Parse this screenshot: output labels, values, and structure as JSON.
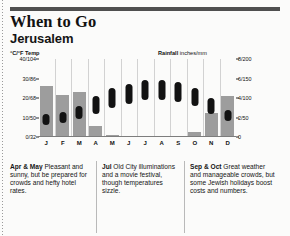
{
  "header": {
    "title": "When to Go",
    "subtitle": "Jerusalem"
  },
  "chart_axes": {
    "left_caption": "°C/°F Temp",
    "right_caption_bold": "Rainfall",
    "right_caption_light": "inches/mm"
  },
  "chart_data": {
    "type": "bar",
    "subtitle": "Jerusalem",
    "xlabel": "",
    "ylabel": "°C/°F Temp",
    "y2label": "Rainfall inches/mm",
    "grid": false,
    "legend": "none",
    "categories": [
      "J",
      "F",
      "M",
      "A",
      "M",
      "J",
      "J",
      "A",
      "S",
      "O",
      "N",
      "D"
    ],
    "temp_axis": {
      "ticks": [
        "40/104",
        "30/86",
        "20/68",
        "10/50",
        "0/32"
      ],
      "tick_values": [
        40,
        30,
        20,
        10,
        0
      ],
      "units": "°C/°F",
      "ylim": [
        0,
        40
      ]
    },
    "rain_axis": {
      "ticks": [
        "8/200",
        "6/150",
        "4/100",
        "2/50",
        "0"
      ],
      "tick_values": [
        8,
        6,
        4,
        2,
        0
      ],
      "units": "inches/mm",
      "ylim": [
        0,
        8
      ]
    },
    "series": [
      {
        "name": "Rainfall",
        "unit": "inches",
        "type": "bar",
        "color": "#9d9d9d",
        "values": [
          5.2,
          4.3,
          4.6,
          1.1,
          0.2,
          0.0,
          0.0,
          0.0,
          0.0,
          0.5,
          2.5,
          4.2
        ]
      },
      {
        "name": "Temperature range",
        "unit": "°C",
        "type": "range-bar",
        "color": "#121212",
        "low": [
          6,
          7,
          9,
          12,
          15,
          17,
          19,
          19,
          18,
          16,
          12,
          8
        ],
        "high": [
          12,
          13,
          16,
          21,
          25,
          27,
          29,
          29,
          28,
          25,
          20,
          14
        ]
      }
    ]
  },
  "captions": [
    {
      "id": "apr-may",
      "lead": "Apr & May",
      "text": " Pleasant and sunny, but be prepared for crowds and hefty hotel rates."
    },
    {
      "id": "jul",
      "lead": "Jul",
      "text": " Old City illuminations and a movie festival, though temperatures sizzle."
    },
    {
      "id": "sep-oct",
      "lead": "Sep & Oct",
      "text": " Great weather and manageable crowds, but some Jewish holidays boost costs and numbers."
    }
  ]
}
